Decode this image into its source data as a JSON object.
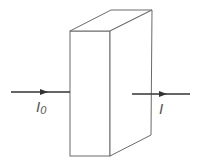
{
  "diagram": {
    "type": "light-absorption-slab",
    "colors": {
      "slab_stroke": "#6a6a6a",
      "arrow": "#333333",
      "label": "#555555"
    },
    "slab": {
      "front_face": {
        "x1": 70,
        "y1": 31,
        "x2": 110,
        "y2": 156
      },
      "depth_offset": {
        "dx": 41,
        "dy": -21
      }
    },
    "incident_beam": {
      "label_main": "I",
      "label_sub": "0"
    },
    "transmitted_beam": {
      "label_main": "I"
    }
  }
}
